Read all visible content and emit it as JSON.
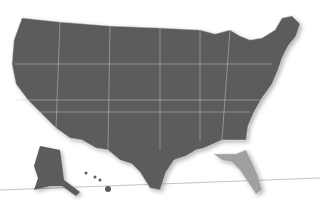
{
  "map": {
    "title": "United States relief map",
    "highlighted_state": "Florida",
    "colors": {
      "land": "#5a5a5a",
      "borders": "#bdbdbd",
      "highlight": "#9a9a9a",
      "background": "#ffffff",
      "line": "#999999"
    },
    "insets": [
      "Alaska",
      "Hawaii"
    ]
  }
}
